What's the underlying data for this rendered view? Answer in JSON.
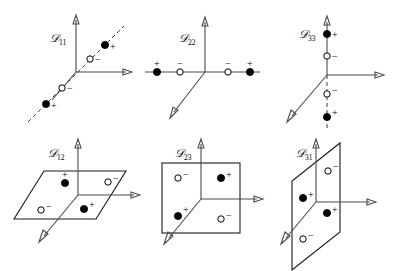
{
  "figure": {
    "background_color": "#ffffff",
    "width": 397,
    "height": 271,
    "axis_color": "#4a4a4a",
    "line_color": "#1a1a1a",
    "marker_filled_color": "#000000",
    "marker_open_color": "#ffffff",
    "sign_plus": "+",
    "sign_minus": "−",
    "script_d": "𝒟"
  },
  "panels": [
    {
      "id": "d11",
      "label_symbol": "𝒟",
      "label_sub": "11",
      "label_full": "𝒟11",
      "geometry": "line-diagonal",
      "description": "3D axes with dashed diagonal line through origin in the x-z plane",
      "markers": [
        {
          "type": "filled",
          "sign": "+",
          "position": "far-upper-right"
        },
        {
          "type": "open",
          "sign": "−",
          "position": "near-upper-right"
        },
        {
          "type": "open",
          "sign": "−",
          "position": "near-lower-left"
        },
        {
          "type": "filled",
          "sign": "+",
          "position": "far-lower-left"
        }
      ]
    },
    {
      "id": "d22",
      "label_symbol": "𝒟",
      "label_sub": "22",
      "label_full": "𝒟22",
      "geometry": "line-horizontal",
      "description": "3D axes with four markers along the horizontal x-axis",
      "markers": [
        {
          "type": "filled",
          "sign": "+",
          "position": "far-left"
        },
        {
          "type": "open",
          "sign": "−",
          "position": "near-left"
        },
        {
          "type": "open",
          "sign": "−",
          "position": "near-right"
        },
        {
          "type": "filled",
          "sign": "+",
          "position": "far-right"
        }
      ]
    },
    {
      "id": "d33",
      "label_symbol": "𝒟",
      "label_sub": "33",
      "label_full": "𝒟33",
      "geometry": "line-vertical",
      "description": "3D axes with four markers along the vertical y-axis, dashed below origin",
      "markers": [
        {
          "type": "filled",
          "sign": "+",
          "position": "far-top"
        },
        {
          "type": "open",
          "sign": "−",
          "position": "near-top"
        },
        {
          "type": "open",
          "sign": "−",
          "position": "near-bottom"
        },
        {
          "type": "filled",
          "sign": "+",
          "position": "far-bottom"
        }
      ]
    },
    {
      "id": "d12",
      "label_symbol": "𝒟",
      "label_sub": "12",
      "label_full": "𝒟12",
      "geometry": "plane-horizontal",
      "description": "Horizontal parallelogram plane containing four alternating markers",
      "markers": [
        {
          "type": "filled",
          "sign": "+",
          "position": "back-left"
        },
        {
          "type": "open",
          "sign": "−",
          "position": "back-right"
        },
        {
          "type": "open",
          "sign": "−",
          "position": "front-left"
        },
        {
          "type": "filled",
          "sign": "+",
          "position": "front-right"
        }
      ]
    },
    {
      "id": "d23",
      "label_symbol": "𝒟",
      "label_sub": "23",
      "label_full": "𝒟23",
      "geometry": "plane-frontal",
      "description": "Frontal square plane in the x-y plane with four alternating markers",
      "markers": [
        {
          "type": "open",
          "sign": "−",
          "position": "top-left"
        },
        {
          "type": "filled",
          "sign": "+",
          "position": "top-right"
        },
        {
          "type": "filled",
          "sign": "+",
          "position": "bottom-left"
        },
        {
          "type": "open",
          "sign": "−",
          "position": "bottom-right"
        }
      ]
    },
    {
      "id": "d31",
      "label_symbol": "𝒟",
      "label_sub": "31",
      "label_full": "𝒟31",
      "geometry": "plane-sagittal",
      "description": "Sagittal parallelogram plane in the y-z plane with four alternating markers",
      "markers": [
        {
          "type": "open",
          "sign": "−",
          "position": "top-back"
        },
        {
          "type": "filled",
          "sign": "+",
          "position": "top-front"
        },
        {
          "type": "filled",
          "sign": "+",
          "position": "bottom-back"
        },
        {
          "type": "open",
          "sign": "−",
          "position": "bottom-front"
        }
      ]
    }
  ]
}
